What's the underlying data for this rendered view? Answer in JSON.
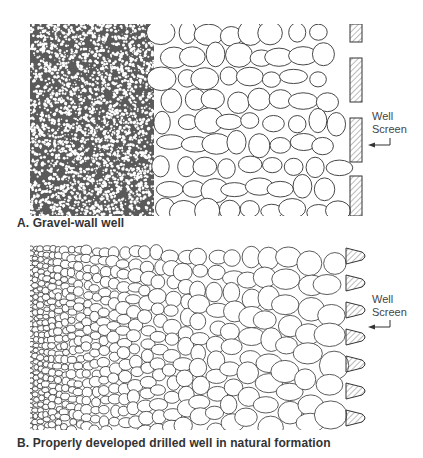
{
  "panels": [
    {
      "id": "A",
      "caption": "A. Gravel-wall well",
      "well_screen_label_line1": "Well",
      "well_screen_label_line2": "Screen",
      "regions": [
        "fine natural formation",
        "coarse gravel pack",
        "slotted well screen (rectangular)"
      ]
    },
    {
      "id": "B",
      "caption": "B. Properly developed drilled well in natural formation",
      "well_screen_label_line1": "Well",
      "well_screen_label_line2": "Screen",
      "regions": [
        "graded natural formation (fine to coarse)",
        "well screen (wedge-shaped slots)"
      ]
    }
  ],
  "colors": {
    "ink": "#333333",
    "hatch": "#555555",
    "background": "#ffffff"
  }
}
